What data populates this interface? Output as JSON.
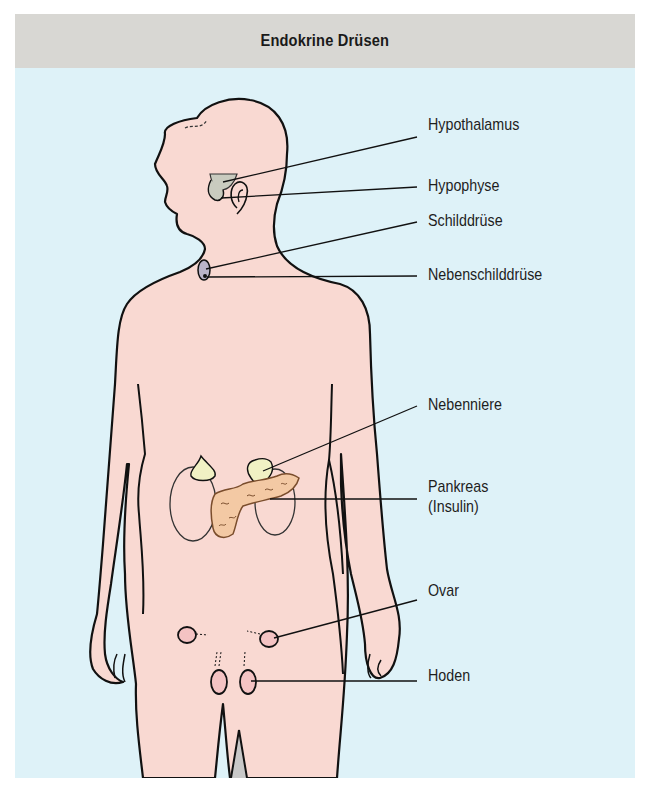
{
  "header": {
    "title": "Endokrine Drüsen"
  },
  "labels": {
    "hypothalamus": "Hypothalamus",
    "hypophyse": "Hypophyse",
    "schilddruese": "Schilddrüse",
    "nebenschilddruese": "Nebenschilddrüse",
    "nebenniere": "Nebenniere",
    "pankreas": "Pankreas",
    "pankreas_note": "(Insulin)",
    "ovar": "Ovar",
    "hoden": "Hoden"
  },
  "colors": {
    "header_bg": "#d8d7d3",
    "panel_bg": "#def2f8",
    "skin": "#f9d9d2",
    "adrenal": "#f1f1c4",
    "pancreas": "#f3c9a4",
    "thyroid": "#b9b3c8",
    "hypothalamus": "#c9cbbf",
    "gonad": "#f4c3c3",
    "outline": "#111111"
  }
}
